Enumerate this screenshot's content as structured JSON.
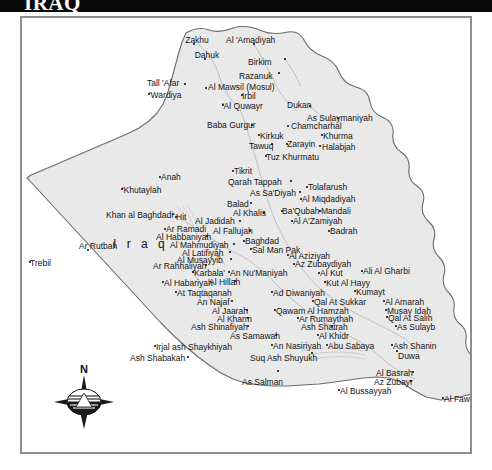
{
  "titlebar": {
    "title": "IRAQ"
  },
  "map": {
    "country_label": "I r a q",
    "compass": {
      "north_label": "N",
      "name": "compass-rose"
    },
    "colors": {
      "title_bar_bg": "#0a0a0a",
      "title_text": "#ffffff",
      "land_fill": "#e9e9e9",
      "neighbor_fill": "#ffffff",
      "border_line": "#6b6b6b",
      "frame": "#8d8d8d",
      "label_text": "#151515"
    },
    "places": [
      {
        "name": "Zakhu",
        "x": 196,
        "y": 35,
        "align": "center",
        "dot_x": 192,
        "dot_y": 42
      },
      {
        "name": "Al 'Amadiyah",
        "x": 225,
        "y": 35,
        "align": "left",
        "dot_x": 252,
        "dot_y": 42
      },
      {
        "name": "Dahuk",
        "x": 206,
        "y": 50,
        "align": "center",
        "dot_x": 203,
        "dot_y": 57
      },
      {
        "name": "Birkim",
        "x": 247,
        "y": 57,
        "align": "left",
        "dot_x": 283,
        "dot_y": 57
      },
      {
        "name": "Razanuk",
        "x": 238,
        "y": 71,
        "align": "left",
        "dot_x": 277,
        "dot_y": 71
      },
      {
        "name": "Tall 'Afar",
        "x": 146,
        "y": 78,
        "align": "left",
        "dot_x": 183,
        "dot_y": 82
      },
      {
        "name": "Al Mawsil (Mosul)",
        "x": 207,
        "y": 82,
        "align": "left",
        "dot_x": 204,
        "dot_y": 86
      },
      {
        "name": "Irbil",
        "x": 241,
        "y": 91,
        "align": "left",
        "dot_x": 240,
        "dot_y": 93
      },
      {
        "name": "'Wardiya",
        "x": 148,
        "y": 90,
        "align": "left",
        "dot_x": 147,
        "dot_y": 92
      },
      {
        "name": "'Al Quwayr",
        "x": 221,
        "y": 101,
        "align": "left",
        "dot_x": 221,
        "dot_y": 103
      },
      {
        "name": "Dukan",
        "x": 286,
        "y": 100,
        "align": "left",
        "dot_x": 308,
        "dot_y": 104
      },
      {
        "name": "As Sulaymaniyah",
        "x": 306,
        "y": 113,
        "align": "left",
        "dot_x": 336,
        "dot_y": 116
      },
      {
        "name": "Baba Gurgur",
        "x": 206,
        "y": 120,
        "align": "left",
        "dot_x": 250,
        "dot_y": 123
      },
      {
        "name": "Chamcharhal",
        "x": 290,
        "y": 121,
        "align": "left",
        "dot_x": 286,
        "dot_y": 124
      },
      {
        "name": "Kirkuk",
        "x": 259,
        "y": 131,
        "align": "left",
        "dot_x": 257,
        "dot_y": 133
      },
      {
        "name": "Khurma",
        "x": 322,
        "y": 131,
        "align": "left",
        "dot_x": 320,
        "dot_y": 133
      },
      {
        "name": "Zarayin",
        "x": 286,
        "y": 139,
        "align": "left",
        "dot_x": 285,
        "dot_y": 142
      },
      {
        "name": "Tawuq",
        "x": 248,
        "y": 141,
        "align": "left",
        "dot_x": 270,
        "dot_y": 142
      },
      {
        "name": "Halabjah",
        "x": 321,
        "y": 142,
        "align": "left",
        "dot_x": 318,
        "dot_y": 144
      },
      {
        "name": "Tuz Khurmatu",
        "x": 265,
        "y": 152,
        "align": "left",
        "dot_x": 264,
        "dot_y": 154
      },
      {
        "name": "Tikrit",
        "x": 233,
        "y": 166,
        "align": "left",
        "dot_x": 231,
        "dot_y": 169
      },
      {
        "name": "Qarah Tappah",
        "x": 227,
        "y": 177,
        "align": "left",
        "dot_x": 289,
        "dot_y": 179
      },
      {
        "name": "Tolafarush",
        "x": 307,
        "y": 182,
        "align": "left",
        "dot_x": 305,
        "dot_y": 185
      },
      {
        "name": "Anah",
        "x": 160,
        "y": 172,
        "align": "left",
        "dot_x": 158,
        "dot_y": 175
      },
      {
        "name": "'Khutaylah",
        "x": 121,
        "y": 185,
        "align": "left",
        "dot_x": 120,
        "dot_y": 187
      },
      {
        "name": "As Sa'Diyah",
        "x": 249,
        "y": 188,
        "align": "left",
        "dot_x": 298,
        "dot_y": 190
      },
      {
        "name": "Al Miqdadiyah",
        "x": 301,
        "y": 194,
        "align": "left",
        "dot_x": 299,
        "dot_y": 197
      },
      {
        "name": "Balad",
        "x": 226,
        "y": 199,
        "align": "left",
        "dot_x": 249,
        "dot_y": 201
      },
      {
        "name": "Khan al Baghdadi",
        "x": 105,
        "y": 210,
        "align": "left",
        "dot_x": 171,
        "dot_y": 212
      },
      {
        "name": "Al Khalis",
        "x": 232,
        "y": 208,
        "align": "left",
        "dot_x": 262,
        "dot_y": 211
      },
      {
        "name": "Ba'Qubah",
        "x": 281,
        "y": 206,
        "align": "left",
        "dot_x": 280,
        "dot_y": 209
      },
      {
        "name": "Mandali",
        "x": 320,
        "y": 206,
        "align": "left",
        "dot_x": 318,
        "dot_y": 209
      },
      {
        "name": "Hit",
        "x": 175,
        "y": 212,
        "align": "left",
        "dot_x": 174,
        "dot_y": 215
      },
      {
        "name": "Al Jadidah",
        "x": 194,
        "y": 216,
        "align": "left",
        "dot_x": 238,
        "dot_y": 219
      },
      {
        "name": "Al A'Zamiyah",
        "x": 292,
        "y": 216,
        "align": "left",
        "dot_x": 290,
        "dot_y": 219
      },
      {
        "name": "Ar Ramadi",
        "x": 165,
        "y": 224,
        "align": "left",
        "dot_x": 163,
        "dot_y": 227
      },
      {
        "name": "Al Fallujah",
        "x": 212,
        "y": 226,
        "align": "left",
        "dot_x": 248,
        "dot_y": 229
      },
      {
        "name": "Badrah",
        "x": 329,
        "y": 226,
        "align": "left",
        "dot_x": 327,
        "dot_y": 229
      },
      {
        "name": "Al Habbaniyah",
        "x": 155,
        "y": 232,
        "align": "left",
        "dot_x": 205,
        "dot_y": 234
      },
      {
        "name": "Ar Rutbah",
        "x": 78,
        "y": 241,
        "align": "left",
        "dot_x": 86,
        "dot_y": 248
      },
      {
        "name": "Baghdad",
        "x": 244,
        "y": 236,
        "align": "left",
        "dot_x": 242,
        "dot_y": 239
      },
      {
        "name": "Al Mahmudiyah",
        "x": 169,
        "y": 240,
        "align": "left",
        "dot_x": 232,
        "dot_y": 242
      },
      {
        "name": "Sal Man Pak",
        "x": 251,
        "y": 245,
        "align": "left",
        "dot_x": 249,
        "dot_y": 247
      },
      {
        "name": "Al Latifiyah",
        "x": 181,
        "y": 248,
        "align": "left",
        "dot_x": 228,
        "dot_y": 250
      },
      {
        "name": "Al Aziziyah",
        "x": 288,
        "y": 251,
        "align": "left",
        "dot_x": 286,
        "dot_y": 253
      },
      {
        "name": "Al Musayyib",
        "x": 176,
        "y": 255,
        "align": "left",
        "dot_x": 229,
        "dot_y": 257
      },
      {
        "name": "Az Zubaydiyah",
        "x": 294,
        "y": 259,
        "align": "left",
        "dot_x": 292,
        "dot_y": 262
      },
      {
        "name": "Ar Rahhaliyah",
        "x": 152,
        "y": 261,
        "align": "left",
        "dot_x": 204,
        "dot_y": 263
      },
      {
        "name": "Trebil",
        "x": 29,
        "y": 258,
        "align": "left",
        "dot_x": 28,
        "dot_y": 260
      },
      {
        "name": "Karbala'",
        "x": 193,
        "y": 268,
        "align": "left",
        "dot_x": 191,
        "dot_y": 270
      },
      {
        "name": "An Nu'Maniyah",
        "x": 229,
        "y": 268,
        "align": "left",
        "dot_x": 227,
        "dot_y": 270
      },
      {
        "name": "Al Kut",
        "x": 319,
        "y": 268,
        "align": "left",
        "dot_x": 317,
        "dot_y": 271
      },
      {
        "name": "Ali Al Gharbi",
        "x": 362,
        "y": 266,
        "align": "left",
        "dot_x": 360,
        "dot_y": 269
      },
      {
        "name": "Al Habariyah",
        "x": 163,
        "y": 278,
        "align": "left",
        "dot_x": 161,
        "dot_y": 280
      },
      {
        "name": "Al Hillah",
        "x": 208,
        "y": 277,
        "align": "left",
        "dot_x": 233,
        "dot_y": 279
      },
      {
        "name": "Kut Al Hayy",
        "x": 325,
        "y": 278,
        "align": "left",
        "dot_x": 323,
        "dot_y": 280
      },
      {
        "name": "At Taqtaqanah",
        "x": 176,
        "y": 288,
        "align": "left",
        "dot_x": 174,
        "dot_y": 290
      },
      {
        "name": "Ad Diwaniyah",
        "x": 272,
        "y": 288,
        "align": "left",
        "dot_x": 270,
        "dot_y": 290
      },
      {
        "name": "Kumayt",
        "x": 355,
        "y": 287,
        "align": "left",
        "dot_x": 353,
        "dot_y": 289
      },
      {
        "name": "An Najaf",
        "x": 196,
        "y": 297,
        "align": "left",
        "dot_x": 230,
        "dot_y": 299
      },
      {
        "name": "Qal At Sukkar",
        "x": 313,
        "y": 297,
        "align": "left",
        "dot_x": 311,
        "dot_y": 299
      },
      {
        "name": "Al Amarah",
        "x": 384,
        "y": 297,
        "align": "left",
        "dot_x": 382,
        "dot_y": 299
      },
      {
        "name": "Al Jaarah",
        "x": 211,
        "y": 306,
        "align": "left",
        "dot_x": 245,
        "dot_y": 308
      },
      {
        "name": "Qawam Al Hamzah",
        "x": 275,
        "y": 306,
        "align": "left",
        "dot_x": 273,
        "dot_y": 308
      },
      {
        "name": "Musay Idah",
        "x": 386,
        "y": 306,
        "align": "left",
        "dot_x": 384,
        "dot_y": 308
      },
      {
        "name": "Al Kharm",
        "x": 216,
        "y": 314,
        "align": "left",
        "dot_x": 246,
        "dot_y": 316
      },
      {
        "name": "Ar Rumaythah",
        "x": 298,
        "y": 314,
        "align": "left",
        "dot_x": 296,
        "dot_y": 316
      },
      {
        "name": "Qal At Salih",
        "x": 387,
        "y": 313,
        "align": "left",
        "dot_x": 385,
        "dot_y": 315
      },
      {
        "name": "Ash Shinafiyah",
        "x": 190,
        "y": 322,
        "align": "left",
        "dot_x": 246,
        "dot_y": 324
      },
      {
        "name": "Ash Shatrah",
        "x": 300,
        "y": 322,
        "align": "left",
        "dot_x": 330,
        "dot_y": 324
      },
      {
        "name": "As Sulayb",
        "x": 396,
        "y": 322,
        "align": "left",
        "dot_x": 394,
        "dot_y": 324
      },
      {
        "name": "As Samawah",
        "x": 229,
        "y": 331,
        "align": "left",
        "dot_x": 274,
        "dot_y": 333
      },
      {
        "name": "Al Khidr",
        "x": 318,
        "y": 331,
        "align": "left",
        "dot_x": 316,
        "dot_y": 333
      },
      {
        "name": "Irjal ash Shaykhiyah",
        "x": 155,
        "y": 342,
        "align": "left",
        "dot_x": 153,
        "dot_y": 344
      },
      {
        "name": "An Nasiriyah",
        "x": 272,
        "y": 341,
        "align": "left",
        "dot_x": 270,
        "dot_y": 343
      },
      {
        "name": "Abu Sabaya",
        "x": 327,
        "y": 341,
        "align": "left",
        "dot_x": 325,
        "dot_y": 343
      },
      {
        "name": "Ash Shanin",
        "x": 392,
        "y": 341,
        "align": "left",
        "dot_x": 390,
        "dot_y": 343
      },
      {
        "name": "Ash Shabakah",
        "x": 129,
        "y": 353,
        "align": "left",
        "dot_x": 186,
        "dot_y": 355
      },
      {
        "name": "Suq Ash Shuyukh",
        "x": 249,
        "y": 353,
        "align": "left",
        "dot_x": 310,
        "dot_y": 351
      },
      {
        "name": "Duwa",
        "x": 397,
        "y": 351,
        "align": "left",
        "dot_x": 395,
        "dot_y": 349
      },
      {
        "name": "As Salman",
        "x": 241,
        "y": 377,
        "align": "left",
        "dot_x": 276,
        "dot_y": 369
      },
      {
        "name": "Al Basrah",
        "x": 375,
        "y": 368,
        "align": "left",
        "dot_x": 411,
        "dot_y": 370
      },
      {
        "name": "Az Zubayr",
        "x": 373,
        "y": 377,
        "align": "left",
        "dot_x": 409,
        "dot_y": 379
      },
      {
        "name": "Al Bussayyah",
        "x": 339,
        "y": 386,
        "align": "left",
        "dot_x": 337,
        "dot_y": 388
      },
      {
        "name": "Al Faw",
        "x": 443,
        "y": 394,
        "align": "left",
        "dot_x": 441,
        "dot_y": 396
      }
    ]
  }
}
